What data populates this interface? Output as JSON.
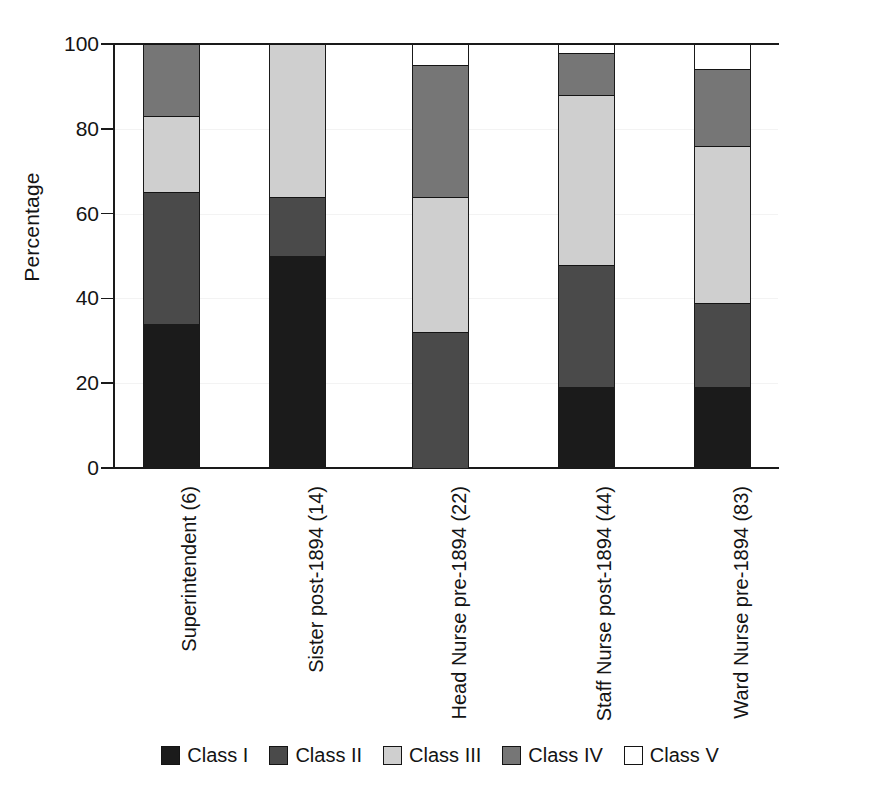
{
  "chart_data": {
    "type": "bar",
    "subtype": "stacked-bar-100-percent",
    "title": "",
    "xlabel": "",
    "ylabel": "Percentage",
    "ylim": [
      0,
      100
    ],
    "yticks": [
      0,
      20,
      40,
      60,
      80,
      100
    ],
    "grid": false,
    "legend_position": "bottom",
    "stacked": true,
    "categories": [
      "Superintendent (6)",
      "Sister post-1894 (14)",
      "Head Nurse pre-1894 (22)",
      "Staff Nurse post-1894 (44)",
      "Ward Nurse pre-1894 (83)"
    ],
    "series": [
      {
        "name": "Class I",
        "color": "#1b1b1b",
        "values": [
          34,
          50,
          0,
          19,
          19
        ]
      },
      {
        "name": "Class II",
        "color": "#4a4a4a",
        "values": [
          31,
          14,
          32,
          29,
          20
        ]
      },
      {
        "name": "Class III",
        "color": "#cfcfcf",
        "values": [
          18,
          36,
          32,
          40,
          37
        ]
      },
      {
        "name": "Class IV",
        "color": "#767676",
        "values": [
          17,
          0,
          31,
          10,
          18
        ]
      },
      {
        "name": "Class V",
        "color": "#ffffff",
        "values": [
          0,
          0,
          5,
          2,
          6
        ]
      }
    ],
    "cumulative_tops": [
      [
        34,
        65,
        83,
        100,
        100
      ],
      [
        50,
        64,
        100,
        100,
        100
      ],
      [
        0,
        32,
        64,
        95,
        100
      ],
      [
        19,
        48,
        88,
        98,
        100
      ],
      [
        19,
        39,
        76,
        94,
        100
      ]
    ]
  },
  "axis": {
    "y_title": "Percentage",
    "y_tick_labels": [
      "0",
      "20",
      "40",
      "60",
      "80",
      "100"
    ]
  },
  "legend": {
    "items": [
      {
        "label": "Class I",
        "swatch": "legend-swatch-class-1"
      },
      {
        "label": "Class II",
        "swatch": "legend-swatch-class-2"
      },
      {
        "label": "Class III",
        "swatch": "legend-swatch-class-3"
      },
      {
        "label": "Class IV",
        "swatch": "legend-swatch-class-4"
      },
      {
        "label": "Class V",
        "swatch": "legend-swatch-class-5"
      }
    ]
  }
}
